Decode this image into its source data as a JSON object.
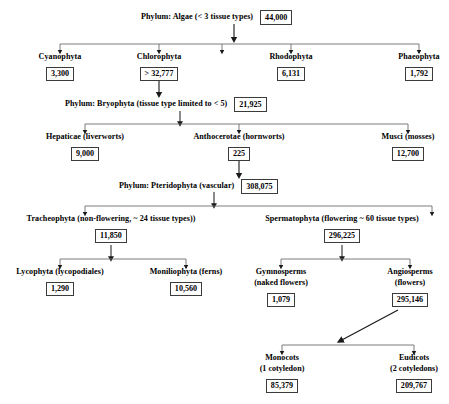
{
  "diagram": {
    "title_text": "Plant phyla classification with species counts",
    "line_color": "#6e6e6e",
    "box_border_color": "#3b3b3b",
    "text_color": "#000000"
  },
  "nodes": {
    "algae": {
      "label": "Phylum: Algae (< 3 tissue types)",
      "value": "44,000"
    },
    "cyanophyta": {
      "label": "Cyanophyta",
      "value": "3,300"
    },
    "chlorophyta": {
      "label": "Chlorophyta",
      "value": "> 32,777"
    },
    "rhodophyta": {
      "label": "Rhodophyta",
      "value": "6,131"
    },
    "phaeophyta": {
      "label": "Phaeophyta",
      "value": "1,792"
    },
    "bryophyta": {
      "label": "Phylum: Bryophyta (tissue type limited to < 5)",
      "value": "21,925"
    },
    "hepaticae": {
      "label": "Hepaticae (liverworts)",
      "value": "9,000"
    },
    "anthocerotae": {
      "label": "Anthocerotae (hornworts)",
      "value": "225"
    },
    "musci": {
      "label": "Musci (mosses)",
      "value": "12,700"
    },
    "pteridophyta": {
      "label": "Phylum: Pteridophyta (vascular)",
      "value": "308,075"
    },
    "tracheophyta": {
      "label": "Tracheophyta (non-flowering, ~ 24 tissue types))",
      "value": "11,850"
    },
    "spermatophyta": {
      "label": "Spermatophyta (flowering ~ 60 tissue types)",
      "value": "296,225"
    },
    "lycophyta": {
      "label": "Lycophyta (lycopodiales)",
      "value": "1,290"
    },
    "moniliophyta": {
      "label": "Moniliophyta (ferns)",
      "value": "10,560"
    },
    "gymnosperms": {
      "label_line1": "Gymnosperms",
      "label_line2": "(naked flowers)",
      "value": "1,079"
    },
    "angiosperms": {
      "label_line1": "Angiosperms",
      "label_line2": "(flowers)",
      "value": "295,146"
    },
    "monocots": {
      "label_line1": "Monocots",
      "label_line2": "(1 cotyledon)",
      "value": "85,379"
    },
    "eudicots": {
      "label_line1": "Eudicots",
      "label_line2": "(2 cotyledons)",
      "value": "209,767"
    }
  }
}
